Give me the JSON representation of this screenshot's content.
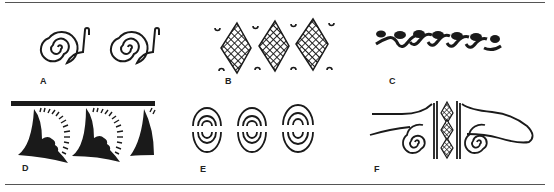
{
  "figure": {
    "ink_color": "#1a1a1a",
    "rule_color": "#555555",
    "panels": [
      {
        "id": "A",
        "label": "A",
        "description": "Pair of coiled spirals with hooked tails"
      },
      {
        "id": "B",
        "label": "B",
        "description": "Three cross-hatched diamonds with small arcs between"
      },
      {
        "id": "C",
        "label": "C",
        "description": "Running wave-scroll band"
      },
      {
        "id": "D",
        "label": "D",
        "description": "Solid band with hanging black triangles and radiating dashes"
      },
      {
        "id": "E",
        "label": "E",
        "description": "Three ovals of concentric split arcs"
      },
      {
        "id": "F",
        "label": "F",
        "description": "Winged motif with central hatched diamonds and twin spirals"
      }
    ]
  }
}
